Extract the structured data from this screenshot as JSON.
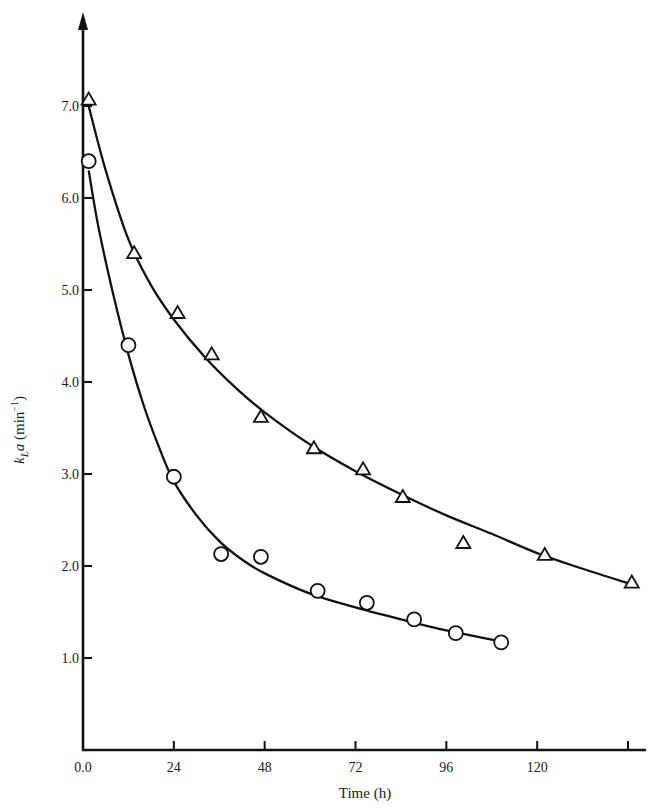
{
  "chart_data": {
    "type": "scatter",
    "title": "",
    "xlabel": "Time (h)",
    "ylabel": "k_L a (min^-1)",
    "ylabel_parts": {
      "k": "k",
      "sub": "L",
      "a": "a",
      "units_open": " (min",
      "sup": "−1",
      "units_close": ")"
    },
    "xlim": [
      0,
      152
    ],
    "ylim": [
      0,
      7.8
    ],
    "x_ticks": [
      0,
      24,
      48,
      72,
      96,
      120,
      144
    ],
    "x_tick_labels": [
      "0.0",
      "24",
      "48",
      "72",
      "96",
      "120",
      ""
    ],
    "y_ticks": [
      1.0,
      2.0,
      3.0,
      4.0,
      5.0,
      6.0,
      7.0
    ],
    "y_tick_labels": [
      "1.0",
      "2.0",
      "3.0",
      "4.0",
      "5.0",
      "6.0",
      "7.0"
    ],
    "grid": false,
    "legend": null,
    "series": [
      {
        "name": "triangles",
        "marker": "triangle",
        "fit_curve": true,
        "x": [
          1.5,
          13.5,
          25,
          34,
          47,
          61,
          74,
          84.5,
          100.5,
          122,
          145
        ],
        "y": [
          7.07,
          5.4,
          4.75,
          4.3,
          3.62,
          3.28,
          3.05,
          2.75,
          2.25,
          2.12,
          1.82
        ],
        "curve": [
          [
            1.5,
            7.0
          ],
          [
            6,
            6.3
          ],
          [
            12,
            5.55
          ],
          [
            18,
            5.05
          ],
          [
            24,
            4.68
          ],
          [
            32,
            4.28
          ],
          [
            40,
            3.95
          ],
          [
            48,
            3.67
          ],
          [
            60,
            3.32
          ],
          [
            72,
            3.03
          ],
          [
            84,
            2.78
          ],
          [
            96,
            2.55
          ],
          [
            108,
            2.35
          ],
          [
            120,
            2.14
          ],
          [
            132,
            1.97
          ],
          [
            145,
            1.8
          ]
        ]
      },
      {
        "name": "circles",
        "marker": "circle",
        "fit_curve": true,
        "x": [
          1.5,
          12,
          24,
          36.5,
          47,
          62,
          75,
          87.5,
          98.5,
          110.5
        ],
        "y": [
          6.4,
          4.4,
          2.97,
          2.13,
          2.1,
          1.73,
          1.6,
          1.42,
          1.27,
          1.17
        ],
        "curve": [
          [
            1.5,
            6.3
          ],
          [
            4,
            5.7
          ],
          [
            8,
            4.95
          ],
          [
            12,
            4.3
          ],
          [
            16,
            3.75
          ],
          [
            20,
            3.3
          ],
          [
            24,
            2.92
          ],
          [
            30,
            2.55
          ],
          [
            36,
            2.27
          ],
          [
            42,
            2.07
          ],
          [
            48,
            1.92
          ],
          [
            60,
            1.7
          ],
          [
            72,
            1.55
          ],
          [
            84,
            1.42
          ],
          [
            96,
            1.3
          ],
          [
            110.5,
            1.18
          ]
        ]
      }
    ]
  }
}
